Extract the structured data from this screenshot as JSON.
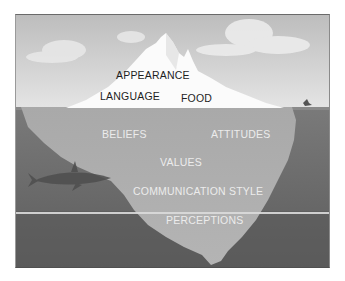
{
  "diagram": {
    "type": "iceberg",
    "colors": {
      "sky_top": "#c4c4c4",
      "sky_bottom": "#e2e2e2",
      "ice_above": "#fafafa",
      "ice_below": "#a8a8a8",
      "water": "#6e6e6e",
      "deep_water": "#555555",
      "divider_line": "#d8d8d8"
    },
    "above_water": {
      "labels": [
        "APPEARANCE",
        "LANGUAGE",
        "FOOD"
      ]
    },
    "below_water": {
      "labels": [
        "BELIEFS",
        "ATTITUDES",
        "VALUES",
        "COMMUNICATION STYLE",
        "PERCEPTIONS"
      ]
    },
    "decorations": [
      "clouds",
      "shark",
      "bird"
    ]
  }
}
